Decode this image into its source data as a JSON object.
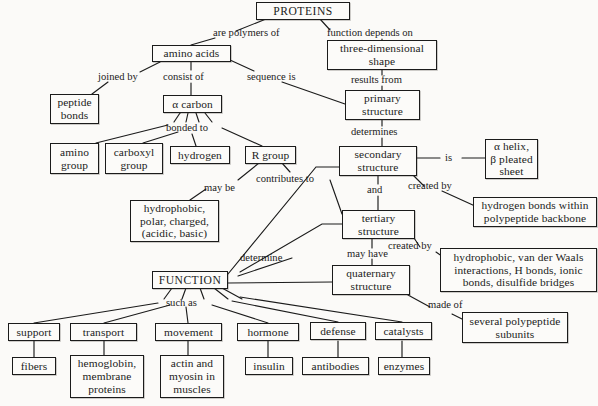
{
  "diagram": {
    "nodes": [
      {
        "id": "proteins",
        "label": "PROTEINS"
      },
      {
        "id": "amino_acids",
        "label": "amino acids"
      },
      {
        "id": "three_dim",
        "label": "three-dimensional\nshape"
      },
      {
        "id": "peptide",
        "label": "peptide\nbonds"
      },
      {
        "id": "alpha_carbon",
        "label": "α carbon"
      },
      {
        "id": "primary",
        "label": "primary\nstructure"
      },
      {
        "id": "amino_group",
        "label": "amino\ngroup"
      },
      {
        "id": "carboxyl",
        "label": "carboxyl\ngroup"
      },
      {
        "id": "hydrogen",
        "label": "hydrogen"
      },
      {
        "id": "r_group",
        "label": "R group"
      },
      {
        "id": "secondary",
        "label": "secondary\nstructure"
      },
      {
        "id": "helix",
        "label": "α helix,\nβ pleated\nsheet"
      },
      {
        "id": "hydrophobic_list",
        "label": "hydrophobic,\npolar, charged,\n(acidic, basic)"
      },
      {
        "id": "tertiary",
        "label": "tertiary\nstructure"
      },
      {
        "id": "hbonds",
        "label": "hydrogen bonds within\npolypeptide backbone"
      },
      {
        "id": "interactions",
        "label": "hydrophobic, van der Waals\ninteractions, H bonds, ionic\nbonds, disulfide bridges"
      },
      {
        "id": "function",
        "label": "FUNCTION"
      },
      {
        "id": "quaternary",
        "label": "quaternary\nstructure"
      },
      {
        "id": "subunits",
        "label": "several polypeptide\nsubunits"
      },
      {
        "id": "support",
        "label": "support"
      },
      {
        "id": "transport",
        "label": "transport"
      },
      {
        "id": "movement",
        "label": "movement"
      },
      {
        "id": "hormone",
        "label": "hormone"
      },
      {
        "id": "defense",
        "label": "defense"
      },
      {
        "id": "catalysts",
        "label": "catalysts"
      },
      {
        "id": "fibers",
        "label": "fibers"
      },
      {
        "id": "hemoglobin",
        "label": "hemoglobin,\nmembrane\nproteins"
      },
      {
        "id": "actin",
        "label": "actin and\nmyosin in\nmuscles"
      },
      {
        "id": "insulin",
        "label": "insulin"
      },
      {
        "id": "antibodies",
        "label": "antibodies"
      },
      {
        "id": "enzymes",
        "label": "enzymes"
      }
    ],
    "link_labels": [
      {
        "id": "are_polymers_of",
        "text": "are polymers of"
      },
      {
        "id": "function_depends",
        "text": "function depends on"
      },
      {
        "id": "joined_by",
        "text": "joined by"
      },
      {
        "id": "consist_of",
        "text": "consist of"
      },
      {
        "id": "sequence_is",
        "text": "sequence is"
      },
      {
        "id": "results_from",
        "text": "results from"
      },
      {
        "id": "bonded_to",
        "text": "bonded to"
      },
      {
        "id": "determines",
        "text": "determines"
      },
      {
        "id": "is",
        "text": "is"
      },
      {
        "id": "may_be",
        "text": "may be"
      },
      {
        "id": "contributes_to",
        "text": "contributes to"
      },
      {
        "id": "and",
        "text": "and"
      },
      {
        "id": "created_by_1",
        "text": "created by"
      },
      {
        "id": "created_by_2",
        "text": "created by"
      },
      {
        "id": "may_have",
        "text": "may have"
      },
      {
        "id": "determine",
        "text": "determine"
      },
      {
        "id": "made_of",
        "text": "made of"
      },
      {
        "id": "such_as",
        "text": "such as"
      }
    ]
  }
}
